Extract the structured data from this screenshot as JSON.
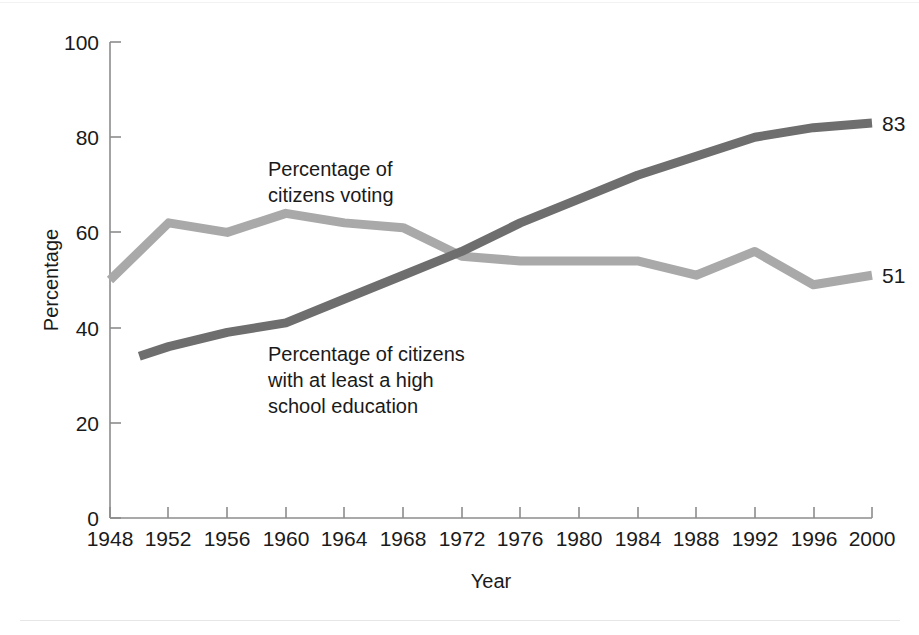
{
  "chart_data": {
    "type": "line",
    "title": "",
    "xlabel": "Year",
    "ylabel": "Percentage",
    "xlim": [
      1948,
      2000
    ],
    "ylim": [
      0,
      100
    ],
    "grid": false,
    "legend_position": "inline-annotations",
    "x": [
      1948,
      1952,
      1956,
      1960,
      1964,
      1968,
      1972,
      1976,
      1980,
      1984,
      1988,
      1992,
      1996,
      2000
    ],
    "xticklabels": [
      "1948",
      "1952",
      "1956",
      "1960",
      "1964",
      "1968",
      "1972",
      "1976",
      "1980",
      "1984",
      "1988",
      "1992",
      "1996",
      "2000"
    ],
    "yticks": [
      0,
      20,
      40,
      60,
      80,
      100
    ],
    "yticklabels": [
      "0",
      "20",
      "40",
      "60",
      "80",
      "100"
    ],
    "series": [
      {
        "name": "Percentage of citizens voting",
        "color": "#a9a9a9",
        "x": [
          1948,
          1952,
          1956,
          1960,
          1964,
          1968,
          1972,
          1976,
          1980,
          1984,
          1988,
          1992,
          1996,
          2000
        ],
        "values": [
          50,
          62,
          60,
          64,
          62,
          61,
          55,
          54,
          54,
          54,
          51,
          56,
          49,
          51
        ],
        "end_label": "51"
      },
      {
        "name": "Percentage of citizens with at least a high school education",
        "color": "#6e6e6e",
        "x": [
          1950,
          1952,
          1956,
          1960,
          1964,
          1968,
          1972,
          1976,
          1980,
          1984,
          1988,
          1992,
          1996,
          2000
        ],
        "values": [
          34,
          36,
          39,
          41,
          46,
          51,
          56,
          62,
          67,
          72,
          76,
          80,
          82,
          83
        ],
        "end_label": "83"
      }
    ],
    "annotations": [
      {
        "id": "voting-annotation",
        "lines": [
          "Percentage of",
          "citizens voting"
        ]
      },
      {
        "id": "education-annotation",
        "lines": [
          "Percentage of citizens",
          "with at least a high",
          "school education"
        ]
      }
    ]
  }
}
